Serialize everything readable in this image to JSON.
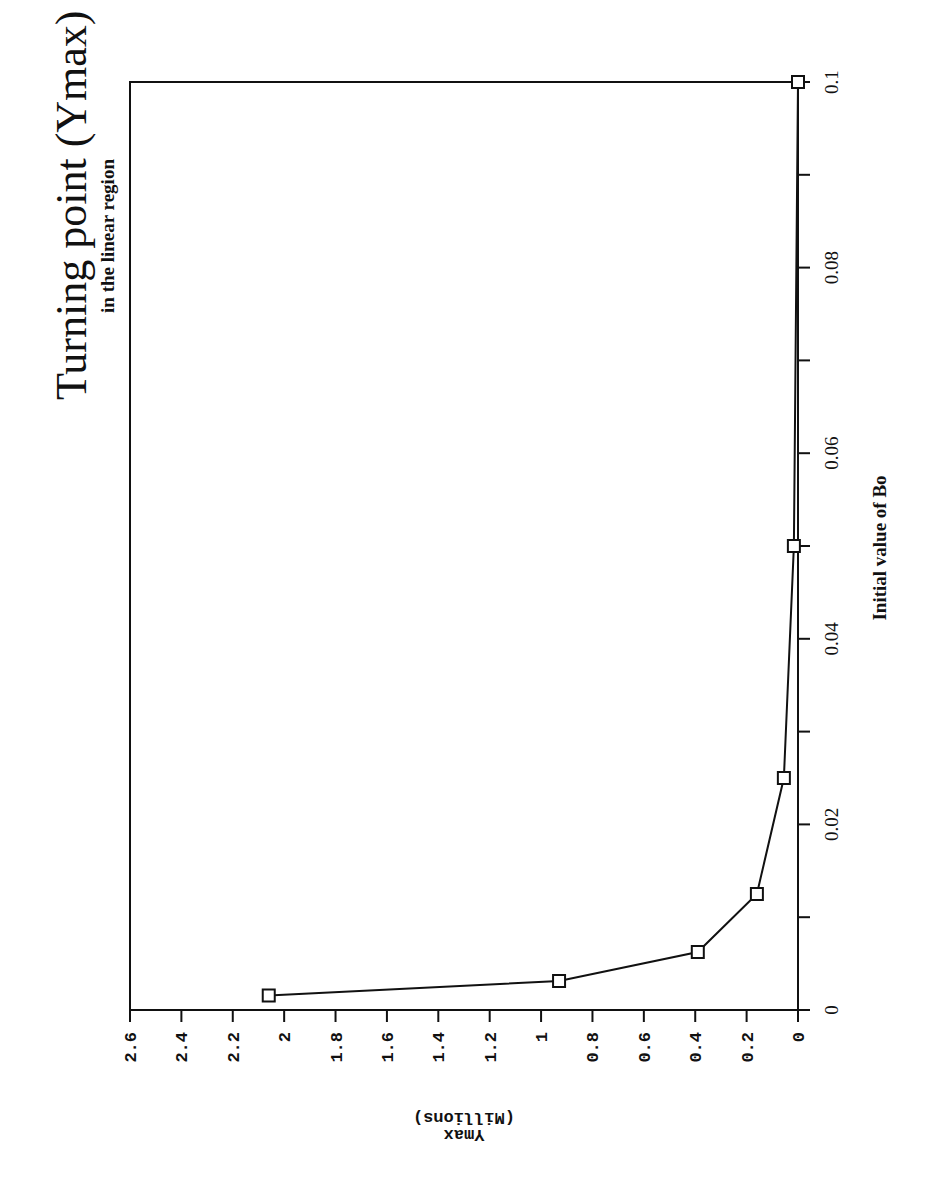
{
  "chart_data": {
    "type": "line",
    "orientation": "rotated 90 degrees clockwise (page in landscape)",
    "title": "Turning point (Ymax) Vs. Bo",
    "subtitle": "in the linear region",
    "xlabel": "Initial value of Bo",
    "ylabel": "Ymax",
    "ylabel_units": "(Millions)",
    "x": [
      0.0015625,
      0.003125,
      0.00625,
      0.0125,
      0.025,
      0.05,
      0.1
    ],
    "series": [
      {
        "name": "Ymax",
        "marker": "square",
        "values": [
          2.06,
          0.93,
          0.39,
          0.16,
          0.055,
          0.016,
          0.0
        ]
      }
    ],
    "xlim": [
      0,
      0.1
    ],
    "ylim": [
      0,
      2.6
    ],
    "x_ticks": [
      "0",
      "0.02",
      "0.04",
      "0.06",
      "0.08",
      "0.1"
    ],
    "y_ticks": [
      "0",
      "0.2",
      "0.4",
      "0.6",
      "0.8",
      "1",
      "1.2",
      "1.4",
      "1.6",
      "1.8",
      "2",
      "2.2",
      "2.4",
      "2.6"
    ],
    "grid": false,
    "legend": "none"
  }
}
